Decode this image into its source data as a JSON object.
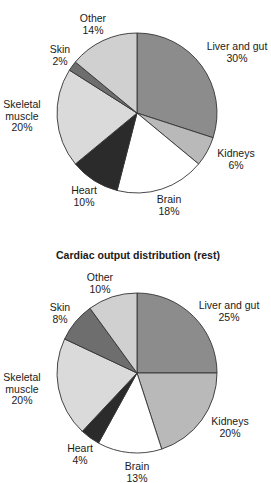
{
  "chart_data": [
    {
      "type": "pie",
      "title": "",
      "title_note": "title cut off at top edge of image",
      "center": [
        137,
        113
      ],
      "radius": 80,
      "start_angle_deg": 0,
      "direction": "clockwise",
      "slices": [
        {
          "label": "Liver and gut",
          "value": 30,
          "color": "#8c8c8c",
          "label_lines": [
            "Liver and gut",
            "30%"
          ],
          "label_pos": [
            237,
            50
          ]
        },
        {
          "label": "Kidneys",
          "value": 6,
          "color": "#b9b9b9",
          "label_lines": [
            "Kidneys",
            "6%"
          ],
          "label_pos": [
            236,
            157
          ]
        },
        {
          "label": "Brain",
          "value": 18,
          "color": "#ffffff",
          "label_lines": [
            "Brain",
            "18%"
          ],
          "label_pos": [
            169,
            203
          ]
        },
        {
          "label": "Heart",
          "value": 10,
          "color": "#2b2b2b",
          "label_lines": [
            "Heart",
            "10%"
          ],
          "label_pos": [
            84,
            194
          ]
        },
        {
          "label": "Skeletal muscle",
          "value": 20,
          "color": "#dadada",
          "label_lines": [
            "Skeletal",
            "muscle",
            "20%"
          ],
          "label_pos": [
            22,
            108
          ]
        },
        {
          "label": "Skin",
          "value": 2,
          "color": "#6e6e6e",
          "label_lines": [
            "Skin",
            "2%"
          ],
          "label_pos": [
            60,
            53
          ]
        },
        {
          "label": "Other",
          "value": 14,
          "color": "#d0d0d0",
          "label_lines": [
            "Other",
            "14%"
          ],
          "label_pos": [
            93,
            22
          ]
        }
      ]
    },
    {
      "type": "pie",
      "title": "Cardiac output distribution (rest)",
      "title_pos": [
        138,
        259
      ],
      "center": [
        137,
        373
      ],
      "radius": 80,
      "start_angle_deg": 0,
      "direction": "clockwise",
      "slices": [
        {
          "label": "Liver and gut",
          "value": 25,
          "color": "#8c8c8c",
          "label_lines": [
            "Liver and gut",
            "25%"
          ],
          "label_pos": [
            229,
            309
          ]
        },
        {
          "label": "Kidneys",
          "value": 20,
          "color": "#b9b9b9",
          "label_lines": [
            "Kidneys",
            "20%"
          ],
          "label_pos": [
            230,
            425
          ]
        },
        {
          "label": "Brain",
          "value": 13,
          "color": "#ffffff",
          "label_lines": [
            "Brain",
            "13%"
          ],
          "label_pos": [
            137,
            470
          ]
        },
        {
          "label": "Heart",
          "value": 4,
          "color": "#2b2b2b",
          "label_lines": [
            "Heart",
            "4%"
          ],
          "label_pos": [
            80,
            452
          ]
        },
        {
          "label": "Skeletal muscle",
          "value": 20,
          "color": "#dadada",
          "label_lines": [
            "Skeletal",
            "muscle",
            "20%"
          ],
          "label_pos": [
            22,
            381
          ]
        },
        {
          "label": "Skin",
          "value": 8,
          "color": "#6e6e6e",
          "label_lines": [
            "Skin",
            "8%"
          ],
          "label_pos": [
            60,
            311
          ]
        },
        {
          "label": "Other",
          "value": 10,
          "color": "#d0d0d0",
          "label_lines": [
            "Other",
            "10%"
          ],
          "label_pos": [
            100,
            281
          ]
        }
      ]
    }
  ],
  "style": {
    "stroke_color": "#333333",
    "text_color": "#1a1a1a",
    "line_height": 11.5
  }
}
